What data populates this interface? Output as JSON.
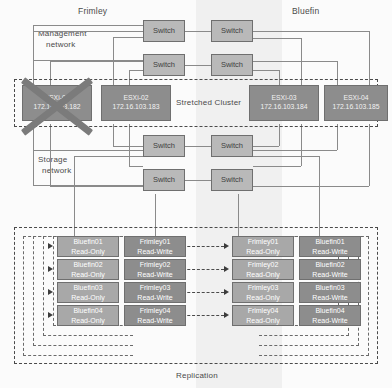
{
  "diagram": {
    "site_left_label": "Frimley",
    "site_right_label": "Bluefin",
    "management_network_label": "Management\nnetwork",
    "management_network_line1": "Management",
    "management_network_line2": "network",
    "storage_network_line1": "Storage",
    "storage_network_line2": "network",
    "cluster_label": "Stretched Cluster",
    "replication_label": "Replication"
  },
  "switches": [
    {
      "label": "Switch"
    },
    {
      "label": "Switch"
    },
    {
      "label": "Switch"
    },
    {
      "label": "Switch"
    },
    {
      "label": "Switch"
    },
    {
      "label": "Switch"
    },
    {
      "label": "Switch"
    },
    {
      "label": "Switch"
    }
  ],
  "hosts": [
    {
      "name": "ESXi-01",
      "ip": "172.16.103.182",
      "failed": true
    },
    {
      "name": "ESXi-02",
      "ip": "172.16.103.183",
      "failed": false
    },
    {
      "name": "ESXi-03",
      "ip": "172.16.103.184",
      "failed": false
    },
    {
      "name": "ESXi-04",
      "ip": "172.16.103.185",
      "failed": false
    }
  ],
  "datastore_columns": [
    {
      "column": "col1",
      "items": [
        {
          "name": "Bluefin01",
          "mode": "Read-Only"
        },
        {
          "name": "Bluefin02",
          "mode": "Read-Only"
        },
        {
          "name": "Bluefin03",
          "mode": "Read-Only"
        },
        {
          "name": "Bluefin04",
          "mode": "Read-Only"
        }
      ]
    },
    {
      "column": "col2",
      "items": [
        {
          "name": "Frimley01",
          "mode": "Read-Write"
        },
        {
          "name": "Frimley02",
          "mode": "Read-Write"
        },
        {
          "name": "Frimley03",
          "mode": "Read-Write"
        },
        {
          "name": "Frimley04",
          "mode": "Read-Write"
        }
      ]
    },
    {
      "column": "col3",
      "items": [
        {
          "name": "Frimley01",
          "mode": "Read-Only"
        },
        {
          "name": "Frimley02",
          "mode": "Read-Only"
        },
        {
          "name": "Frimley03",
          "mode": "Read-Only"
        },
        {
          "name": "Frimley04",
          "mode": "Read-Only"
        }
      ]
    },
    {
      "column": "col4",
      "items": [
        {
          "name": "Bluefin01",
          "mode": "Read-Write"
        },
        {
          "name": "Bluefin02",
          "mode": "Read-Write"
        },
        {
          "name": "Bluefin03",
          "mode": "Read-Write"
        },
        {
          "name": "Bluefin04",
          "mode": "Read-Write"
        }
      ]
    }
  ],
  "colors": {
    "switch_fill": "#b9b9b9",
    "host_fill": "#8d8d8d",
    "datastore_light": "#a8a8a8",
    "datastore_dark": "#8d8d8d",
    "line": "#8a8a8a",
    "dashed": "#4a4a4a",
    "band_mid": "#f0f0f0",
    "x_mark": "#7b7b7b"
  }
}
